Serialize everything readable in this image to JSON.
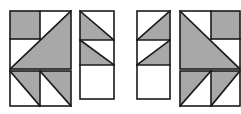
{
  "diagram": {
    "title": "",
    "width": 241,
    "height": 114,
    "colors": {
      "background": "#ffffff",
      "fill": "#a8a8a8",
      "light": "#ffffff",
      "stroke": "#1a1a1a"
    },
    "stroke_width": 1.6,
    "groups": [
      {
        "id": "left-block",
        "name": "left-quilt-block",
        "shapes": [
          {
            "type": "rect",
            "x": 10,
            "y": 11,
            "w": 61,
            "h": 58,
            "fill": "light"
          },
          {
            "type": "rect",
            "x": 10,
            "y": 11,
            "w": 30,
            "h": 28,
            "fill": "fill"
          },
          {
            "type": "poly",
            "points": "10,69 71,11 71,69",
            "fill": "fill"
          },
          {
            "type": "line",
            "x1": 40,
            "y1": 11,
            "x2": 40,
            "y2": 39
          },
          {
            "type": "line",
            "x1": 10,
            "y1": 39,
            "x2": 40,
            "y2": 39
          },
          {
            "type": "line",
            "x1": 10,
            "y1": 69,
            "x2": 71,
            "y2": 11
          },
          {
            "type": "rect",
            "x": 10,
            "y": 71,
            "w": 61,
            "h": 35,
            "fill": "light"
          },
          {
            "type": "poly",
            "points": "10,71 40,71 40,106",
            "fill": "fill"
          },
          {
            "type": "poly",
            "points": "40,71 71,71 71,106",
            "fill": "fill"
          },
          {
            "type": "line",
            "x1": 40,
            "y1": 71,
            "x2": 40,
            "y2": 106
          },
          {
            "type": "line",
            "x1": 10,
            "y1": 71,
            "x2": 40,
            "y2": 106
          },
          {
            "type": "line",
            "x1": 40,
            "y1": 71,
            "x2": 71,
            "y2": 106
          }
        ]
      },
      {
        "id": "strip-2",
        "name": "center-left-strip",
        "shapes": [
          {
            "type": "rect",
            "x": 80,
            "y": 11,
            "w": 34,
            "h": 88,
            "fill": "light"
          },
          {
            "type": "poly",
            "points": "80,11 80,40 114,40",
            "fill": "fill"
          },
          {
            "type": "poly",
            "points": "80,40 80,65 114,65",
            "fill": "fill"
          },
          {
            "type": "line",
            "x1": 80,
            "y1": 11,
            "x2": 114,
            "y2": 40
          },
          {
            "type": "line",
            "x1": 80,
            "y1": 40,
            "x2": 114,
            "y2": 65
          },
          {
            "type": "line",
            "x1": 80,
            "y1": 40,
            "x2": 114,
            "y2": 40
          },
          {
            "type": "line",
            "x1": 80,
            "y1": 65,
            "x2": 114,
            "y2": 65
          }
        ]
      },
      {
        "id": "strip-3",
        "name": "center-right-strip",
        "shapes": [
          {
            "type": "rect",
            "x": 137,
            "y": 11,
            "w": 33,
            "h": 88,
            "fill": "light"
          },
          {
            "type": "poly",
            "points": "170,11 170,40 137,40",
            "fill": "fill"
          },
          {
            "type": "poly",
            "points": "170,40 170,65 137,65",
            "fill": "fill"
          },
          {
            "type": "line",
            "x1": 170,
            "y1": 11,
            "x2": 137,
            "y2": 40
          },
          {
            "type": "line",
            "x1": 170,
            "y1": 40,
            "x2": 137,
            "y2": 65
          },
          {
            "type": "line",
            "x1": 137,
            "y1": 40,
            "x2": 170,
            "y2": 40
          },
          {
            "type": "line",
            "x1": 137,
            "y1": 65,
            "x2": 170,
            "y2": 65
          }
        ]
      },
      {
        "id": "right-block",
        "name": "right-quilt-block",
        "shapes": [
          {
            "type": "rect",
            "x": 180,
            "y": 11,
            "w": 60,
            "h": 58,
            "fill": "light"
          },
          {
            "type": "rect",
            "x": 211,
            "y": 11,
            "w": 29,
            "h": 28,
            "fill": "fill"
          },
          {
            "type": "poly",
            "points": "180,11 240,69 180,69",
            "fill": "fill"
          },
          {
            "type": "line",
            "x1": 211,
            "y1": 11,
            "x2": 211,
            "y2": 39
          },
          {
            "type": "line",
            "x1": 211,
            "y1": 39,
            "x2": 240,
            "y2": 39
          },
          {
            "type": "line",
            "x1": 180,
            "y1": 11,
            "x2": 240,
            "y2": 69
          },
          {
            "type": "rect",
            "x": 180,
            "y": 71,
            "w": 60,
            "h": 35,
            "fill": "light"
          },
          {
            "type": "poly",
            "points": "180,71 211,71 180,106",
            "fill": "fill"
          },
          {
            "type": "poly",
            "points": "211,71 240,71 211,106",
            "fill": "fill"
          },
          {
            "type": "line",
            "x1": 211,
            "y1": 71,
            "x2": 211,
            "y2": 106
          },
          {
            "type": "line",
            "x1": 211,
            "y1": 71,
            "x2": 180,
            "y2": 106
          },
          {
            "type": "line",
            "x1": 240,
            "y1": 71,
            "x2": 211,
            "y2": 106
          }
        ]
      }
    ]
  }
}
